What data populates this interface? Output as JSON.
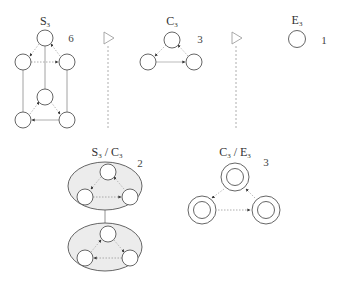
{
  "colors": {
    "stroke": "#555555",
    "light_edge": "#9a9a9a",
    "dashed_edge": "#888888",
    "ellipse_fill": "#ececec",
    "triangle": "#a0a0a0",
    "background": "#ffffff"
  },
  "graphs": {
    "s3": {
      "label_main": "S",
      "label_sub": "3",
      "count": "6"
    },
    "c3": {
      "label_main": "C",
      "label_sub": "3",
      "count": "3"
    },
    "e3": {
      "label_main": "E",
      "label_sub": "3",
      "count": "1"
    },
    "s3_c3": {
      "label_a": "S",
      "label_a_sub": "3",
      "sep": " / ",
      "label_b": "C",
      "label_b_sub": "3",
      "count": "2"
    },
    "c3_e3": {
      "label_a": "C",
      "label_a_sub": "3",
      "sep": " / ",
      "label_b": "E",
      "label_b_sub": "3",
      "count": "3"
    }
  },
  "icons": {
    "arrow_triangle_1": "triangle-right-outline",
    "arrow_triangle_2": "triangle-right-outline"
  }
}
